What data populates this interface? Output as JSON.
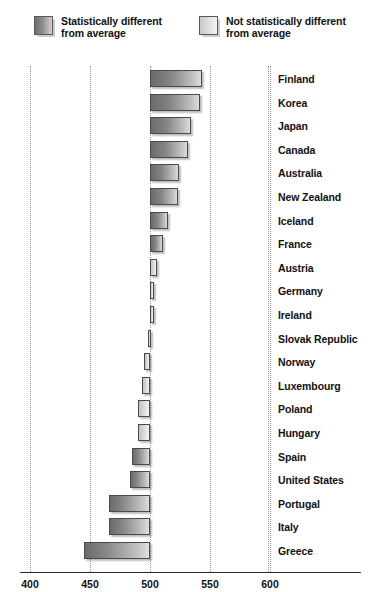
{
  "legend": {
    "items": [
      {
        "id": "significant",
        "label": "Statistically different\nfrom average",
        "swatch": "dark-gray-gradient",
        "color": "#8e8e8e"
      },
      {
        "id": "not-significant",
        "label": "Not statistically different\nfrom average",
        "swatch": "light-gray-gradient",
        "color": "#dcdcdc"
      }
    ]
  },
  "axis": {
    "ticks": [
      "400",
      "450",
      "500",
      "550",
      "600"
    ],
    "tick_values": [
      400,
      450,
      500,
      550,
      600
    ],
    "min": 400,
    "max": 600,
    "baseline": 500,
    "gridlines": true
  },
  "chart_data": {
    "type": "bar",
    "orientation": "horizontal",
    "title": "",
    "xlabel": "",
    "ylabel": "",
    "xlim": [
      400,
      600
    ],
    "baseline": 500,
    "grid": true,
    "legend_position": "top",
    "categories": [
      "Finland",
      "Korea",
      "Japan",
      "Canada",
      "Australia",
      "New Zealand",
      "Iceland",
      "France",
      "Austria",
      "Germany",
      "Ireland",
      "Slovak Republic",
      "Norway",
      "Luxembourg",
      "Poland",
      "Hungary",
      "Spain",
      "United States",
      "Portugal",
      "Italy",
      "Greece"
    ],
    "values": [
      543,
      542,
      534,
      532,
      524,
      523,
      515,
      511,
      506,
      503,
      503,
      498,
      495,
      493,
      490,
      490,
      485,
      483,
      466,
      466,
      445
    ],
    "significance": [
      true,
      true,
      true,
      true,
      true,
      true,
      true,
      true,
      false,
      false,
      false,
      false,
      false,
      false,
      false,
      false,
      true,
      true,
      true,
      true,
      true
    ],
    "series": [
      {
        "name": "Mean score",
        "values": [
          543,
          542,
          534,
          532,
          524,
          523,
          515,
          511,
          506,
          503,
          503,
          498,
          495,
          493,
          490,
          490,
          485,
          483,
          466,
          466,
          445
        ]
      }
    ]
  }
}
